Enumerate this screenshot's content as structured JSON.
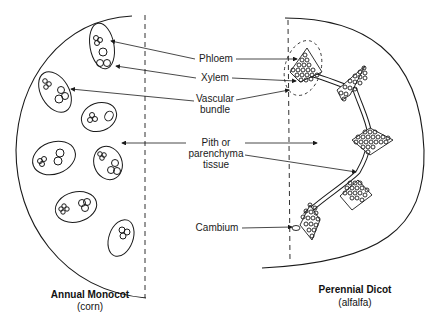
{
  "diagram": {
    "labels": {
      "phloem": "Phloem",
      "xylem": "Xylem",
      "vascular_bundle_line1": "Vascular",
      "vascular_bundle_line2": "bundle",
      "pith_line1": "Pith or",
      "pith_line2": "parenchyma",
      "pith_line3": "tissue",
      "cambium": "Cambium"
    },
    "left_panel": {
      "title": "Annual Monocot",
      "subtitle": "(corn)",
      "description": "Scattered vascular bundles (ovals) each with phloem and xylem clusters"
    },
    "right_panel": {
      "title": "Perennial Dicot",
      "subtitle": "(alfalfa)",
      "description": "Vascular bundles arranged in a ring connected by cambium; one bundle outlined with dashed oval"
    },
    "colors": {
      "ink": "#1a1a1a",
      "background": "#ffffff"
    }
  }
}
